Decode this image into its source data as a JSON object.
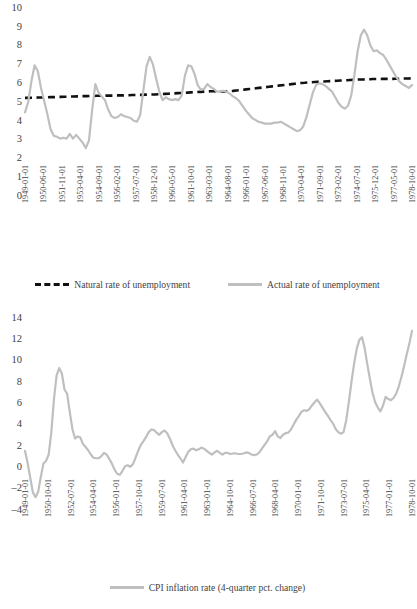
{
  "colors": {
    "actual_line": "#bfbfbf",
    "natural_line": "#111111",
    "cpi_line": "#bfbfbf",
    "text": "#3f3f3f",
    "background": "#ffffff"
  },
  "chart_data": [
    {
      "type": "line",
      "id": "unemployment-chart",
      "title": "",
      "xlabel": "",
      "ylabel": "",
      "ylim": [
        0,
        10
      ],
      "yticks": [
        0,
        1,
        2,
        3,
        4,
        5,
        6,
        7,
        8,
        9,
        10
      ],
      "grid": false,
      "legend_position": "bottom",
      "xtick_labels": [
        "1949-01-01",
        "1950-06-01",
        "1951-11-01",
        "1953-04-01",
        "1954-09-01",
        "1956-02-01",
        "1957-07-01",
        "1958-12-01",
        "1960-05-01",
        "1961-10-01",
        "1963-03-01",
        "1964-08-01",
        "1966-01-01",
        "1967-06-01",
        "1968-11-01",
        "1970-04-01",
        "1971-09-01",
        "1973-02-01",
        "1974-07-01",
        "1975-12-01",
        "1977-05-01",
        "1978-10-01"
      ],
      "series": [
        {
          "name": "Natural rate of unemployment",
          "style": "dashed",
          "color": "#111111",
          "values": [
            5.22,
            5.22,
            5.23,
            5.23,
            5.24,
            5.24,
            5.25,
            5.25,
            5.26,
            5.26,
            5.27,
            5.27,
            5.28,
            5.28,
            5.29,
            5.29,
            5.3,
            5.3,
            5.31,
            5.31,
            5.32,
            5.32,
            5.33,
            5.33,
            5.33,
            5.34,
            5.34,
            5.34,
            5.35,
            5.35,
            5.35,
            5.36,
            5.36,
            5.37,
            5.37,
            5.38,
            5.38,
            5.39,
            5.39,
            5.4,
            5.4,
            5.41,
            5.42,
            5.43,
            5.44,
            5.45,
            5.46,
            5.47,
            5.48,
            5.49,
            5.5,
            5.51,
            5.52,
            5.53,
            5.54,
            5.55,
            5.56,
            5.57,
            5.57,
            5.56,
            5.56,
            5.56,
            5.57,
            5.58,
            5.59,
            5.61,
            5.63,
            5.65,
            5.67,
            5.69,
            5.71,
            5.73,
            5.75,
            5.77,
            5.79,
            5.81,
            5.83,
            5.85,
            5.87,
            5.89,
            5.91,
            5.93,
            5.95,
            5.97,
            5.99,
            6.01,
            6.02,
            6.04,
            6.05,
            6.06,
            6.07,
            6.08,
            6.09,
            6.1,
            6.11,
            6.12,
            6.13,
            6.14,
            6.15,
            6.16,
            6.17,
            6.18,
            6.19,
            6.2,
            6.2,
            6.21,
            6.21,
            6.22,
            6.22,
            6.22,
            6.23,
            6.23,
            6.23,
            6.23,
            6.24,
            6.24,
            6.25,
            6.25,
            6.25,
            6.26
          ]
        },
        {
          "name": "Actual rate of unemployment",
          "style": "solid",
          "color": "#bfbfbf",
          "values": [
            4.45,
            5.0,
            6.1,
            6.95,
            6.65,
            5.75,
            5.05,
            4.35,
            3.55,
            3.2,
            3.15,
            3.05,
            3.1,
            3.05,
            3.3,
            3.05,
            3.25,
            3.05,
            2.85,
            2.55,
            2.95,
            4.6,
            5.95,
            5.5,
            5.3,
            5.1,
            4.6,
            4.25,
            4.15,
            4.2,
            4.35,
            4.25,
            4.2,
            4.15,
            4.0,
            3.95,
            4.3,
            5.6,
            6.9,
            7.4,
            7.0,
            6.25,
            5.55,
            5.1,
            5.25,
            5.15,
            5.1,
            5.15,
            5.1,
            5.35,
            6.4,
            6.95,
            6.9,
            6.5,
            5.9,
            5.65,
            5.7,
            5.95,
            5.8,
            5.7,
            5.55,
            5.55,
            5.6,
            5.55,
            5.45,
            5.3,
            5.2,
            5.05,
            4.8,
            4.55,
            4.35,
            4.15,
            4.05,
            3.95,
            3.9,
            3.85,
            3.85,
            3.85,
            3.9,
            3.9,
            3.95,
            3.85,
            3.75,
            3.65,
            3.55,
            3.45,
            3.5,
            3.7,
            4.2,
            4.85,
            5.5,
            5.9,
            6.0,
            5.95,
            5.85,
            5.7,
            5.55,
            5.25,
            4.95,
            4.75,
            4.65,
            4.8,
            5.35,
            6.45,
            7.7,
            8.55,
            8.85,
            8.55,
            8.0,
            7.7,
            7.75,
            7.6,
            7.5,
            7.25,
            6.95,
            6.65,
            6.35,
            6.1,
            5.95,
            5.85,
            5.75,
            5.9
          ]
        }
      ]
    },
    {
      "type": "line",
      "id": "cpi-inflation-chart",
      "title": "",
      "xlabel": "",
      "ylabel": "",
      "ylim": [
        -4,
        14
      ],
      "yticks": [
        -4,
        -2,
        0,
        2,
        4,
        6,
        8,
        10,
        12,
        14
      ],
      "grid": false,
      "legend_position": "bottom",
      "xtick_labels": [
        "1949-01-01",
        "1950-10-01",
        "1952-07-01",
        "1954-04-01",
        "1956-01-01",
        "1957-10-01",
        "1959-07-01",
        "1961-04-01",
        "1963-01-01",
        "1964-10-01",
        "1966-07-01",
        "1968-04-01",
        "1970-01-01",
        "1971-10-01",
        "1973-07-01",
        "1975-04-01",
        "1977-01-01",
        "1978-10-01"
      ],
      "series": [
        {
          "name": "CPI inflation rate (4-quarter pct. change)",
          "style": "solid",
          "color": "#bfbfbf",
          "values": [
            1.55,
            0.4,
            -1.0,
            -2.35,
            -2.8,
            -2.3,
            -0.9,
            0.35,
            0.6,
            1.2,
            3.3,
            6.4,
            8.6,
            9.3,
            8.8,
            7.3,
            6.9,
            5.2,
            3.6,
            2.7,
            2.9,
            2.8,
            2.2,
            1.9,
            1.6,
            1.2,
            0.9,
            0.85,
            0.85,
            1.05,
            1.35,
            1.2,
            0.8,
            0.35,
            -0.2,
            -0.6,
            -0.7,
            -0.35,
            0.1,
            0.2,
            0.05,
            0.3,
            0.9,
            1.55,
            2.1,
            2.45,
            2.85,
            3.3,
            3.55,
            3.5,
            3.25,
            3.05,
            3.3,
            3.45,
            3.2,
            2.7,
            2.1,
            1.6,
            1.2,
            0.85,
            0.45,
            0.95,
            1.45,
            1.7,
            1.75,
            1.6,
            1.7,
            1.85,
            1.75,
            1.55,
            1.35,
            1.2,
            1.4,
            1.55,
            1.35,
            1.2,
            1.35,
            1.35,
            1.25,
            1.3,
            1.3,
            1.25,
            1.25,
            1.3,
            1.4,
            1.35,
            1.2,
            1.15,
            1.2,
            1.4,
            1.75,
            2.1,
            2.45,
            2.9,
            3.05,
            3.4,
            2.9,
            2.75,
            3.05,
            3.2,
            3.25,
            3.55,
            4.0,
            4.45,
            4.8,
            5.2,
            5.35,
            5.3,
            5.45,
            5.8,
            6.1,
            6.35,
            6.0,
            5.6,
            5.2,
            4.85,
            4.45,
            4.1,
            3.6,
            3.3,
            3.15,
            3.3,
            4.4,
            6.1,
            8.0,
            9.7,
            11.1,
            11.95,
            12.2,
            11.2,
            9.7,
            8.3,
            7.0,
            6.1,
            5.6,
            5.25,
            5.8,
            6.6,
            6.4,
            6.3,
            6.5,
            6.9,
            7.6,
            8.5,
            9.5,
            10.6,
            11.6,
            12.8
          ]
        }
      ]
    }
  ],
  "chart1": {
    "legend": [
      {
        "label": "Natural rate of unemployment",
        "style": "dashed"
      },
      {
        "label": "Actual rate of unemployment",
        "style": "solid"
      }
    ]
  },
  "chart2": {
    "legend": [
      {
        "label": "CPI inflation rate (4-quarter pct. change)",
        "style": "solid"
      }
    ]
  }
}
